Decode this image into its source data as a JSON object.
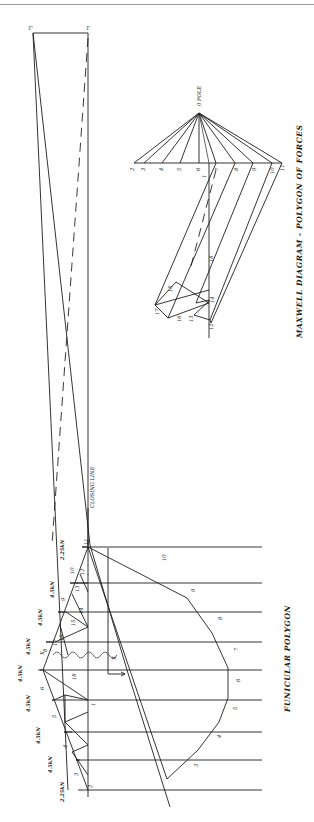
{
  "titles": {
    "maxwell": "MAXWELL DIAGRAM - POLYGON OF FORCES",
    "funicular": "FUNICULAR POLYGON",
    "closing_line": "CLOSING LINE"
  },
  "maxwell_diagram": {
    "pole_label": "0 POLE",
    "load_points": [
      "2",
      "3",
      "4",
      "5",
      "6",
      "7",
      "8",
      "9",
      "10",
      "11"
    ],
    "interior_points": [
      "1",
      "12",
      "13",
      "14",
      "15",
      "16",
      "17",
      "18"
    ],
    "top_points": [
      "T'",
      "T"
    ]
  },
  "truss": {
    "loads": [
      "2.25kN",
      "4.5kN",
      "4.5kN",
      "4.5kN",
      "4.5kN",
      "4.5kN",
      "4.5kN",
      "4.5kN",
      "2.25kN"
    ],
    "node_labels": [
      "2",
      "11"
    ],
    "member_labels": [
      "3",
      "4",
      "5",
      "6",
      "7",
      "8",
      "9",
      "10",
      "12",
      "13",
      "14",
      "15",
      "16",
      "17",
      "18",
      "1"
    ],
    "section_marks": [
      "X",
      "X"
    ]
  },
  "funicular": {
    "segment_labels": [
      "3",
      "4",
      "5",
      "6",
      "7",
      "8",
      "9",
      "10"
    ]
  }
}
